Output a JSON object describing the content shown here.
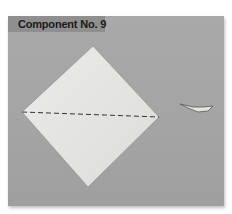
{
  "figure": {
    "label": "Component No. 9",
    "colors": {
      "background": "#a6a6a6",
      "label_bar": "#8f8f8f",
      "paper": "#e6e6e2",
      "dashed_line": "#333333"
    },
    "elements": [
      {
        "name": "square-paper-diamond",
        "description": "Square paper rotated 45° with dashed fold line across the horizontal diagonal"
      },
      {
        "name": "small-paper-piece",
        "description": "Small folded paper piece"
      }
    ]
  }
}
